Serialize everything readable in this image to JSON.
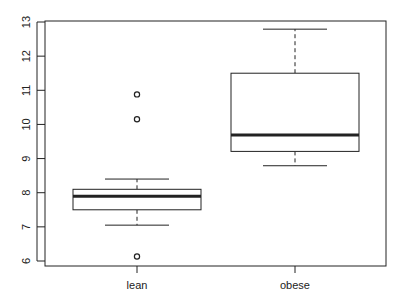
{
  "chart_data": {
    "type": "boxplot",
    "title": "",
    "xlabel": "",
    "ylabel": "",
    "ylim": [
      6,
      13
    ],
    "yticks": [
      6,
      7,
      8,
      9,
      10,
      11,
      12,
      13
    ],
    "categories": [
      "lean",
      "obese"
    ],
    "grid": false,
    "legend": null,
    "boxes": [
      {
        "name": "lean",
        "whisker_low": 7.05,
        "q1": 7.5,
        "median": 7.9,
        "q3": 8.1,
        "whisker_high": 8.4,
        "outliers": [
          6.13,
          10.15,
          10.88
        ]
      },
      {
        "name": "obese",
        "whisker_low": 8.79,
        "q1": 9.21,
        "median": 9.69,
        "q3": 11.5,
        "whisker_high": 12.79,
        "outliers": []
      }
    ]
  },
  "colors": {
    "stroke": "#222222",
    "background": "#ffffff"
  }
}
